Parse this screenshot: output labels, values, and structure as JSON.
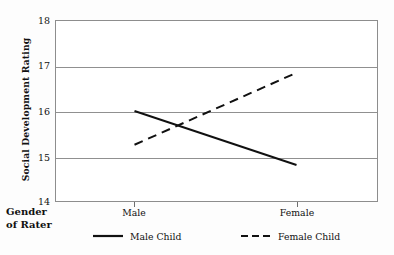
{
  "chart_data": {
    "type": "line",
    "title": "",
    "subtitle": "",
    "xlabel": "Gender of Rater",
    "xlabel_line1": "Gender",
    "xlabel_line2": "of Rater",
    "ylabel": "Social Development Rating",
    "categories": [
      "Male",
      "Female"
    ],
    "x_tick_labels": [
      "Male",
      "Female"
    ],
    "y_tick_labels": [
      "18",
      "17",
      "16",
      "15",
      "14"
    ],
    "y_ticks": [
      14,
      15,
      16,
      17,
      18
    ],
    "ylim": [
      14,
      18
    ],
    "grid": "horizontal",
    "legend_position": "bottom",
    "series": [
      {
        "name": "Male Child",
        "style": "solid",
        "color": "#111111",
        "values": [
          16.0,
          14.8
        ]
      },
      {
        "name": "Female Child",
        "style": "dashed",
        "color": "#111111",
        "values": [
          15.25,
          16.85
        ]
      }
    ],
    "annotations": []
  },
  "colors": {
    "line": "#111111",
    "gridline": "#909090",
    "frame": "#8d8d8d",
    "background": "#fdfdfd",
    "plot_background": "#ffffff",
    "text": "#111111"
  },
  "legend": {
    "items": [
      {
        "label": "Male Child",
        "style": "solid"
      },
      {
        "label": "Female Child",
        "style": "dashed"
      }
    ]
  }
}
